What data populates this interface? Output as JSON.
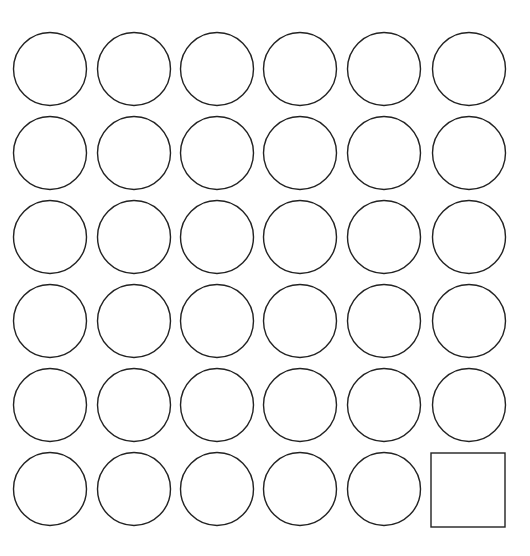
{
  "diagram": {
    "title": "",
    "background": "#ffffff",
    "stroke_color": "#222222",
    "stroke_width": 1.4,
    "grid": {
      "rows": 6,
      "cols": 6,
      "col_centers": [
        50,
        134,
        217,
        300,
        384,
        469
      ],
      "row_centers": [
        69,
        153,
        237,
        321,
        405,
        489
      ],
      "circle_radius": 36.5
    },
    "shapes": [
      {
        "row": 0,
        "col": 0,
        "type": "circle"
      },
      {
        "row": 0,
        "col": 1,
        "type": "circle"
      },
      {
        "row": 0,
        "col": 2,
        "type": "circle"
      },
      {
        "row": 0,
        "col": 3,
        "type": "circle"
      },
      {
        "row": 0,
        "col": 4,
        "type": "circle"
      },
      {
        "row": 0,
        "col": 5,
        "type": "circle"
      },
      {
        "row": 1,
        "col": 0,
        "type": "circle"
      },
      {
        "row": 1,
        "col": 1,
        "type": "circle"
      },
      {
        "row": 1,
        "col": 2,
        "type": "circle"
      },
      {
        "row": 1,
        "col": 3,
        "type": "circle"
      },
      {
        "row": 1,
        "col": 4,
        "type": "circle"
      },
      {
        "row": 1,
        "col": 5,
        "type": "circle"
      },
      {
        "row": 2,
        "col": 0,
        "type": "circle"
      },
      {
        "row": 2,
        "col": 1,
        "type": "circle"
      },
      {
        "row": 2,
        "col": 2,
        "type": "circle"
      },
      {
        "row": 2,
        "col": 3,
        "type": "circle"
      },
      {
        "row": 2,
        "col": 4,
        "type": "circle"
      },
      {
        "row": 2,
        "col": 5,
        "type": "circle"
      },
      {
        "row": 3,
        "col": 0,
        "type": "circle"
      },
      {
        "row": 3,
        "col": 1,
        "type": "circle"
      },
      {
        "row": 3,
        "col": 2,
        "type": "circle"
      },
      {
        "row": 3,
        "col": 3,
        "type": "circle"
      },
      {
        "row": 3,
        "col": 4,
        "type": "circle"
      },
      {
        "row": 3,
        "col": 5,
        "type": "circle"
      },
      {
        "row": 4,
        "col": 0,
        "type": "circle"
      },
      {
        "row": 4,
        "col": 1,
        "type": "circle"
      },
      {
        "row": 4,
        "col": 2,
        "type": "circle"
      },
      {
        "row": 4,
        "col": 3,
        "type": "circle"
      },
      {
        "row": 4,
        "col": 4,
        "type": "circle"
      },
      {
        "row": 4,
        "col": 5,
        "type": "circle"
      },
      {
        "row": 5,
        "col": 0,
        "type": "circle"
      },
      {
        "row": 5,
        "col": 1,
        "type": "circle"
      },
      {
        "row": 5,
        "col": 2,
        "type": "circle"
      },
      {
        "row": 5,
        "col": 3,
        "type": "circle"
      },
      {
        "row": 5,
        "col": 4,
        "type": "circle"
      },
      {
        "row": 5,
        "col": 5,
        "type": "square",
        "x": 431,
        "y": 453,
        "size": 74
      }
    ],
    "counts": {
      "circles": 35,
      "squares": 1
    }
  }
}
